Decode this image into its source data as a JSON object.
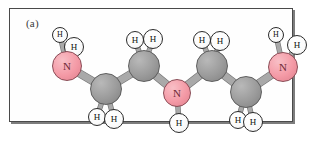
{
  "figure": {
    "panel_label": "(a)",
    "caption_visible": false,
    "frame_color": "#4a4a4a",
    "shadow_color": "#7d7d7d",
    "background_color": "#fefefe"
  },
  "palette": {
    "nitrogen": "#f49aa6",
    "nitrogen_outline": "#8a4b55",
    "carbon": "#9b9b9b",
    "carbon_outline": "#5d5d5d",
    "hydrogen": "#ffffff",
    "hydrogen_outline": "#2b2b2b",
    "bond": "#a9a9a9",
    "bond_outline": "#777777"
  },
  "molecule": {
    "name": "diethylenetriamine chain",
    "formula": "H2N-CH2-CH2-NH-CH2-CH2-NH2",
    "backbone_pattern": "zigzag",
    "atom_counts": {
      "N": 3,
      "C": 4,
      "H": 11
    },
    "atoms": [
      {
        "id": "N1",
        "element": "N",
        "label": "N",
        "cx": 57,
        "cy": 57,
        "r": 15,
        "kind": "nitrogen",
        "size": "large"
      },
      {
        "id": "H1a",
        "element": "H",
        "label": "H",
        "cx": 50,
        "cy": 26,
        "r": 8,
        "kind": "hydrogen",
        "size": "small"
      },
      {
        "id": "H1b",
        "element": "H",
        "label": "H",
        "cx": 64,
        "cy": 38,
        "r": 10,
        "kind": "hydrogen",
        "size": "large"
      },
      {
        "id": "C1",
        "element": "C",
        "label": "",
        "cx": 96,
        "cy": 80,
        "r": 16,
        "kind": "carbon",
        "size": "large"
      },
      {
        "id": "H2a",
        "element": "H",
        "label": "H",
        "cx": 87,
        "cy": 108,
        "r": 9,
        "kind": "hydrogen",
        "size": "mid"
      },
      {
        "id": "H2b",
        "element": "H",
        "label": "H",
        "cx": 104,
        "cy": 110,
        "r": 10,
        "kind": "hydrogen",
        "size": "large"
      },
      {
        "id": "C2",
        "element": "C",
        "label": "",
        "cx": 134,
        "cy": 57,
        "r": 16,
        "kind": "carbon",
        "size": "large"
      },
      {
        "id": "H3a",
        "element": "H",
        "label": "H",
        "cx": 125,
        "cy": 31,
        "r": 9,
        "kind": "hydrogen",
        "size": "mid"
      },
      {
        "id": "H3b",
        "element": "H",
        "label": "H",
        "cx": 143,
        "cy": 30,
        "r": 10,
        "kind": "hydrogen",
        "size": "large"
      },
      {
        "id": "N2",
        "element": "N",
        "label": "N",
        "cx": 167,
        "cy": 84,
        "r": 14,
        "kind": "nitrogen",
        "size": "large"
      },
      {
        "id": "H4",
        "element": "H",
        "label": "H",
        "cx": 169,
        "cy": 114,
        "r": 10,
        "kind": "hydrogen",
        "size": "large"
      },
      {
        "id": "C3",
        "element": "C",
        "label": "",
        "cx": 202,
        "cy": 57,
        "r": 16,
        "kind": "carbon",
        "size": "large"
      },
      {
        "id": "H5a",
        "element": "H",
        "label": "H",
        "cx": 192,
        "cy": 31,
        "r": 9,
        "kind": "hydrogen",
        "size": "mid"
      },
      {
        "id": "H5b",
        "element": "H",
        "label": "H",
        "cx": 210,
        "cy": 32,
        "r": 10,
        "kind": "hydrogen",
        "size": "large"
      },
      {
        "id": "C4",
        "element": "C",
        "label": "",
        "cx": 236,
        "cy": 83,
        "r": 16,
        "kind": "carbon",
        "size": "large"
      },
      {
        "id": "H6a",
        "element": "H",
        "label": "H",
        "cx": 228,
        "cy": 111,
        "r": 9,
        "kind": "hydrogen",
        "size": "mid"
      },
      {
        "id": "H6b",
        "element": "H",
        "label": "H",
        "cx": 243,
        "cy": 113,
        "r": 10,
        "kind": "hydrogen",
        "size": "large"
      },
      {
        "id": "N3",
        "element": "N",
        "label": "N",
        "cx": 273,
        "cy": 58,
        "r": 15,
        "kind": "nitrogen",
        "size": "large"
      },
      {
        "id": "H7a",
        "element": "H",
        "label": "H",
        "cx": 266,
        "cy": 26,
        "r": 8,
        "kind": "hydrogen",
        "size": "small"
      },
      {
        "id": "H7b",
        "element": "H",
        "label": "H",
        "cx": 287,
        "cy": 36,
        "r": 10,
        "kind": "hydrogen",
        "size": "large"
      }
    ],
    "bonds": [
      {
        "from": "N1",
        "to": "H1a",
        "type": "thin"
      },
      {
        "from": "N1",
        "to": "H1b",
        "type": "thin"
      },
      {
        "from": "N1",
        "to": "C1",
        "type": "thick"
      },
      {
        "from": "C1",
        "to": "H2a",
        "type": "thin"
      },
      {
        "from": "C1",
        "to": "H2b",
        "type": "thin"
      },
      {
        "from": "C1",
        "to": "C2",
        "type": "thick"
      },
      {
        "from": "C2",
        "to": "H3a",
        "type": "thin"
      },
      {
        "from": "C2",
        "to": "H3b",
        "type": "thin"
      },
      {
        "from": "C2",
        "to": "N2",
        "type": "thick"
      },
      {
        "from": "N2",
        "to": "H4",
        "type": "thin"
      },
      {
        "from": "N2",
        "to": "C3",
        "type": "thick"
      },
      {
        "from": "C3",
        "to": "H5a",
        "type": "thin"
      },
      {
        "from": "C3",
        "to": "H5b",
        "type": "thin"
      },
      {
        "from": "C3",
        "to": "C4",
        "type": "thick"
      },
      {
        "from": "C4",
        "to": "H6a",
        "type": "thin"
      },
      {
        "from": "C4",
        "to": "H6b",
        "type": "thin"
      },
      {
        "from": "C4",
        "to": "N3",
        "type": "thick"
      },
      {
        "from": "N3",
        "to": "H7a",
        "type": "thin"
      },
      {
        "from": "N3",
        "to": "H7b",
        "type": "thin"
      }
    ]
  }
}
